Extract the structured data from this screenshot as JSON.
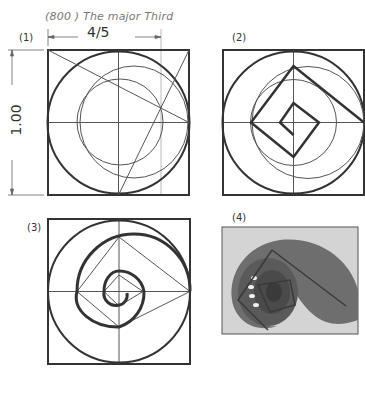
{
  "figure": {
    "title": "(800 ) The major Third",
    "dimension_horizontal": "4/5",
    "dimension_vertical": "1.00"
  },
  "panels": [
    {
      "id": "1",
      "label": "(1)",
      "content": "square with inscribed circle, offset circles, diagonal construction lines"
    },
    {
      "id": "2",
      "label": "(2)",
      "content": "square with circles and nested rotated-square spiral"
    },
    {
      "id": "3",
      "label": "(3)",
      "content": "square with circular spiral and inscribed rotated squares"
    },
    {
      "id": "4",
      "label": "(4)",
      "content": "photograph of nautilus shell with overlaid spiral squares"
    }
  ],
  "colors": {
    "line_dark": "#333333",
    "line_thin": "#555555",
    "line_faint": "#999999",
    "background": "#ffffff"
  }
}
